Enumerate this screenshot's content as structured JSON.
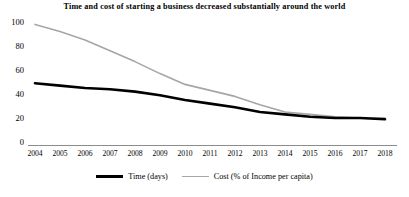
{
  "chart_data": {
    "type": "line",
    "title": "Time and cost of starting a business decreased substantially around the world",
    "xlabel": "",
    "ylabel": "",
    "ylim": [
      0,
      100
    ],
    "yticks": [
      0,
      20,
      40,
      60,
      80,
      100
    ],
    "grid": false,
    "legend_position": "bottom-center",
    "categories": [
      "2004",
      "2005",
      "2006",
      "2007",
      "2008",
      "2009",
      "2010",
      "2011",
      "2012",
      "2013",
      "2014",
      "2015",
      "2016",
      "2017",
      "2018"
    ],
    "series": [
      {
        "name": "Time (days)",
        "color": "#000000",
        "line_width": 2.6,
        "values": [
          49,
          47,
          45,
          44,
          42,
          39,
          35,
          32,
          29,
          25,
          23,
          21,
          20,
          20,
          19
        ]
      },
      {
        "name": "Cost (% of Income per capita)",
        "color": "#a6a6a6",
        "line_width": 1.6,
        "values": [
          98,
          92,
          85,
          76,
          67,
          57,
          48,
          43,
          38,
          31,
          25,
          23,
          21,
          20,
          20
        ]
      }
    ]
  },
  "axis": {
    "y_tick_labels": [
      "100",
      "80",
      "60",
      "40",
      "20",
      "0"
    ],
    "x_tick_labels": [
      "2004",
      "2005",
      "2006",
      "2007",
      "2008",
      "2009",
      "2010",
      "2011",
      "2012",
      "2013",
      "2014",
      "2015",
      "2016",
      "2017",
      "2018"
    ]
  },
  "legend": {
    "items": [
      {
        "label": "Time (days)",
        "swatch": "thick-black-line"
      },
      {
        "label": "Cost (% of Income per capita)",
        "swatch": "thin-gray-line"
      }
    ]
  },
  "colors": {
    "time_series": "#000000",
    "cost_series": "#a6a6a6",
    "axis": "#808080",
    "background": "#ffffff"
  }
}
